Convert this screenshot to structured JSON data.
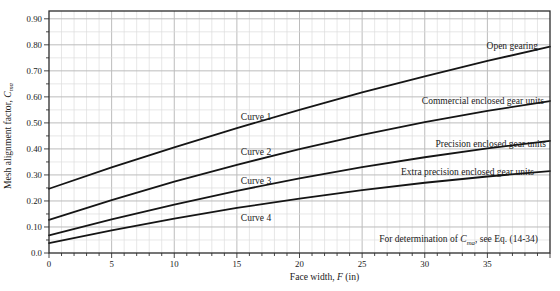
{
  "figure": {
    "background": "#ffffff",
    "text_color": "#1a1a1a",
    "curve_color": "#151515",
    "border_color": "#2b2b2b",
    "grid_minor_color": "#dddddd",
    "grid_major_color": "#bcbcbc"
  },
  "chart_data": {
    "type": "line",
    "xlabel": {
      "pre": "Face width, ",
      "italic": "F",
      "post": " (in)"
    },
    "ylabel": {
      "pre": "Mesh alignment factor, ",
      "italic": "C",
      "sub": "ma"
    },
    "xlim": [
      0,
      40
    ],
    "ylim": [
      0,
      0.93
    ],
    "grid": "on",
    "x_minor_step": 1,
    "y_minor_step": 0.05,
    "x_ticks": [
      0,
      5,
      10,
      15,
      20,
      25,
      30,
      35
    ],
    "x_tick_labels": [
      "0",
      "5",
      "10",
      "15",
      "20",
      "25",
      "30",
      "35"
    ],
    "y_ticks": [
      0,
      0.1,
      0.2,
      0.3,
      0.4,
      0.5,
      0.6,
      0.7,
      0.8,
      0.9
    ],
    "y_tick_labels": [
      "0.0",
      "0.10",
      "0.20",
      "0.30",
      "0.40",
      "0.50",
      "0.60",
      "0.70",
      "0.80",
      "0.90"
    ],
    "x": [
      0,
      5,
      10,
      15,
      20,
      25,
      30,
      35,
      40
    ],
    "series": [
      {
        "name": "Curve 1",
        "label": "Open gearing",
        "values": [
          0.247,
          0.329,
          0.406,
          0.48,
          0.55,
          0.617,
          0.679,
          0.738,
          0.793
        ]
      },
      {
        "name": "Curve 2",
        "label": "Commercial enclosed gear units",
        "values": [
          0.127,
          0.203,
          0.274,
          0.339,
          0.399,
          0.454,
          0.503,
          0.546,
          0.584
        ]
      },
      {
        "name": "Curve 3",
        "label": "Precision enclosed gear units",
        "values": [
          0.068,
          0.129,
          0.186,
          0.239,
          0.287,
          0.33,
          0.368,
          0.402,
          0.431
        ]
      },
      {
        "name": "Curve 4",
        "label": "Extra precision enclosed gear units",
        "values": [
          0.038,
          0.087,
          0.132,
          0.173,
          0.209,
          0.242,
          0.27,
          0.294,
          0.315
        ]
      }
    ],
    "curve_labels": [
      {
        "text": "Curve 1",
        "px": 256,
        "py": 117
      },
      {
        "text": "Curve 2",
        "px": 256,
        "py": 152
      },
      {
        "text": "Curve 3",
        "px": 256,
        "py": 181
      },
      {
        "text": "Curve 4",
        "px": 256,
        "py": 218
      }
    ],
    "series_labels": [
      {
        "text": "Open gearing",
        "right": 538,
        "py": 46
      },
      {
        "text": "Commercial enclosed gear units",
        "right": 544,
        "py": 101
      },
      {
        "text": "Precision enclosed gear units",
        "right": 546,
        "py": 144
      },
      {
        "text": "Extra precision enclosed gear units",
        "right": 534,
        "py": 172
      }
    ],
    "note": {
      "pre": "For determination of ",
      "italic": "C",
      "sub": "ma",
      "post": ", see Eq. (14-34)",
      "right": 538,
      "py": 239
    },
    "legend_position": "inline-right"
  }
}
